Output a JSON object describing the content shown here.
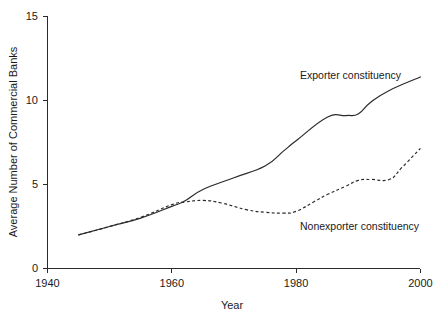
{
  "chart_data": {
    "type": "line",
    "title": "",
    "subtitle": "",
    "xlabel": "Year",
    "ylabel": "Average Number of Commercial Banks",
    "xlim": [
      1940,
      2000
    ],
    "ylim": [
      0,
      15
    ],
    "xticks": [
      1940,
      1960,
      1980,
      2000
    ],
    "yticks": [
      0,
      5,
      10,
      15
    ],
    "xtick_labels": [
      "1940",
      "1960",
      "1980",
      "2000"
    ],
    "ytick_labels": [
      "0",
      "5",
      "10",
      "15"
    ],
    "grid": false,
    "legend_position": "inline-annotation",
    "series": [
      {
        "name": "Exporter constituency",
        "style": "solid",
        "color": "#2b2b2b",
        "annotation": "Exporter constituency",
        "x": [
          1945,
          1950,
          1955,
          1960,
          1962,
          1965,
          1970,
          1975,
          1978,
          1980,
          1985,
          1988,
          1990,
          1992,
          1995,
          2000
        ],
        "values": [
          2.0,
          2.5,
          3.0,
          3.7,
          4.0,
          4.7,
          5.4,
          6.1,
          7.0,
          7.6,
          9.0,
          9.1,
          9.2,
          9.9,
          10.6,
          11.4
        ]
      },
      {
        "name": "Nonexporter constituency",
        "style": "dashed",
        "color": "#2b2b2b",
        "annotation": "Nonexporter constituency",
        "x": [
          1945,
          1950,
          1955,
          1960,
          1962,
          1965,
          1968,
          1972,
          1975,
          1978,
          1980,
          1983,
          1985,
          1988,
          1990,
          1992,
          1995,
          1997,
          2000
        ],
        "values": [
          2.0,
          2.5,
          3.05,
          3.8,
          3.95,
          4.05,
          3.9,
          3.5,
          3.35,
          3.3,
          3.4,
          4.0,
          4.4,
          4.9,
          5.25,
          5.3,
          5.3,
          6.0,
          7.15
        ]
      }
    ]
  },
  "annotations": {
    "exporter_label": "Exporter constituency",
    "nonexporter_label": "Nonexporter constituency"
  }
}
